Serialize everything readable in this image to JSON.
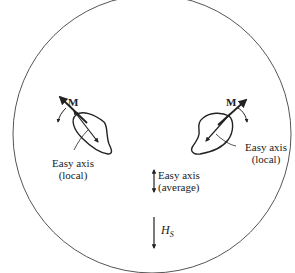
{
  "diagram": {
    "type": "magnetic-domain-schematic",
    "circle": {
      "cx": 152,
      "cy": 134,
      "r": 139,
      "stroke": "#444444"
    },
    "left_grain": {
      "moment_label": "M",
      "easy_axis_label_line1": "Easy axis",
      "easy_axis_label_line2": "(local)"
    },
    "right_grain": {
      "moment_label": "M",
      "easy_axis_label_line1": "Easy axis",
      "easy_axis_label_line2": "(local)"
    },
    "average_axis": {
      "label_line1": "Easy axis",
      "label_line2": "(average)"
    },
    "field": {
      "symbol": "H",
      "subscript": "S"
    }
  }
}
